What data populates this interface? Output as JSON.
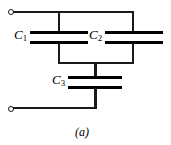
{
  "figure": {
    "caption": "(a)",
    "type": "capacitor-network-schematic",
    "line_color": "#1a1a1a",
    "plate_color": "#000000",
    "background_color": "#ffffff"
  },
  "components": {
    "c1": {
      "label": "C",
      "subscript": "1",
      "name": "capacitor-c1"
    },
    "c2": {
      "label": "C",
      "subscript": "2",
      "name": "capacitor-c2"
    },
    "c3": {
      "label": "C",
      "subscript": "3",
      "name": "capacitor-c3"
    }
  },
  "terminals": {
    "top": {
      "name": "terminal-top"
    },
    "bottom": {
      "name": "terminal-bottom"
    }
  },
  "chart_data": {
    "type": "diagram",
    "title": "(a)",
    "elements": [
      {
        "id": "C1",
        "kind": "capacitor",
        "label": "C1",
        "x": 59,
        "y": 37
      },
      {
        "id": "C2",
        "kind": "capacitor",
        "label": "C2",
        "x": 133,
        "y": 37
      },
      {
        "id": "C3",
        "kind": "capacitor",
        "label": "C3",
        "x": 95,
        "y": 82
      },
      {
        "id": "T1",
        "kind": "terminal",
        "label": "",
        "x": 11,
        "y": 12
      },
      {
        "id": "T2",
        "kind": "terminal",
        "label": "",
        "x": 11,
        "y": 109
      }
    ],
    "connections": [
      {
        "from": "T1",
        "to": "C1"
      },
      {
        "from": "T1",
        "to": "C2"
      },
      {
        "from": "C1",
        "to": "C3"
      },
      {
        "from": "C2",
        "to": "C3"
      },
      {
        "from": "C3",
        "to": "T2"
      }
    ]
  }
}
